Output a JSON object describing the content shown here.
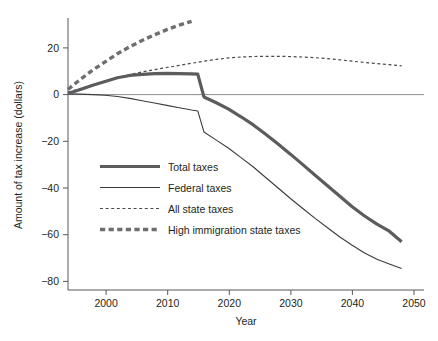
{
  "chart_data": {
    "type": "line",
    "title": "",
    "xlabel": "Year",
    "ylabel": "Amount of tax increase (dollars)",
    "xlim": [
      1994,
      2050
    ],
    "ylim": [
      -85,
      34
    ],
    "xticks": [
      2000,
      2010,
      2020,
      2030,
      2040,
      2050
    ],
    "xtick_labels": [
      "2000",
      "2010",
      "2020",
      "2030",
      "2040",
      "2050"
    ],
    "yticks": [
      20,
      0,
      -20,
      -40,
      -60,
      -80
    ],
    "ytick_labels": [
      "20",
      "0",
      "−20",
      "−40",
      "−60",
      "−80"
    ],
    "grid": false,
    "zero_reference_line": true,
    "legend_position": "center-left",
    "series": [
      {
        "name": "Total taxes",
        "style": "thick-solid",
        "color": "#5b5c5e",
        "x": [
          1994,
          1996,
          1998,
          2000,
          2002,
          2004,
          2006,
          2008,
          2010,
          2012,
          2014,
          2015,
          2016,
          2018,
          2020,
          2022,
          2024,
          2026,
          2028,
          2030,
          2032,
          2034,
          2036,
          2038,
          2040,
          2042,
          2044,
          2046,
          2048
        ],
        "values": [
          0.5,
          2.2,
          4.0,
          5.6,
          7.2,
          8.2,
          8.7,
          9.0,
          9.1,
          9.0,
          8.9,
          8.8,
          -1.0,
          -3.5,
          -6.2,
          -9.5,
          -13.0,
          -17.0,
          -21.2,
          -25.5,
          -30.0,
          -34.5,
          -39.0,
          -43.5,
          -48.0,
          -52.0,
          -55.5,
          -58.5,
          -63.0
        ]
      },
      {
        "name": "Federal taxes",
        "style": "thin-solid",
        "color": "#3b3c3e",
        "x": [
          1994,
          1996,
          1998,
          2000,
          2002,
          2004,
          2006,
          2008,
          2010,
          2012,
          2014,
          2015,
          2016,
          2018,
          2020,
          2022,
          2024,
          2026,
          2028,
          2030,
          2032,
          2034,
          2036,
          2038,
          2040,
          2042,
          2044,
          2046,
          2048
        ],
        "values": [
          0.3,
          0.2,
          0.0,
          -0.3,
          -0.8,
          -1.6,
          -2.6,
          -3.6,
          -4.6,
          -5.6,
          -6.6,
          -7.0,
          -16.0,
          -19.5,
          -23.0,
          -27.0,
          -31.0,
          -35.5,
          -40.0,
          -44.5,
          -48.8,
          -53.0,
          -57.0,
          -61.0,
          -64.5,
          -67.8,
          -70.5,
          -72.5,
          -74.5
        ]
      },
      {
        "name": "All state taxes",
        "style": "thin-dashed",
        "color": "#4a4b4d",
        "x": [
          1994,
          1996,
          1998,
          2000,
          2002,
          2004,
          2006,
          2008,
          2010,
          2012,
          2014,
          2016,
          2018,
          2020,
          2022,
          2024,
          2026,
          2028,
          2030,
          2032,
          2034,
          2036,
          2038,
          2040,
          2042,
          2044,
          2046,
          2048
        ],
        "values": [
          1.0,
          2.6,
          4.2,
          5.8,
          7.3,
          8.6,
          9.7,
          10.7,
          11.6,
          12.5,
          13.4,
          14.3,
          15.1,
          15.7,
          16.1,
          16.3,
          16.4,
          16.4,
          16.3,
          16.1,
          15.8,
          15.4,
          14.9,
          14.3,
          13.8,
          13.3,
          12.8,
          12.3
        ]
      },
      {
        "name": "High immigration state taxes",
        "style": "thick-dashed",
        "color": "#6d6e70",
        "x": [
          1994,
          1996,
          1998,
          2000,
          2002,
          2004,
          2006,
          2008,
          2010,
          2012,
          2014
        ],
        "values": [
          2.2,
          6.5,
          10.5,
          14.0,
          17.5,
          20.5,
          23.2,
          25.6,
          27.8,
          29.8,
          31.4
        ]
      }
    ]
  },
  "legend": {
    "items": [
      {
        "label": "Total taxes",
        "swatch": "thick-solid-swatch"
      },
      {
        "label": "Federal taxes",
        "swatch": "thin-solid-swatch"
      },
      {
        "label": "All state taxes",
        "swatch": "thin-dashed-swatch"
      },
      {
        "label": "High immigration state taxes",
        "swatch": "thick-dashed-swatch"
      }
    ]
  }
}
